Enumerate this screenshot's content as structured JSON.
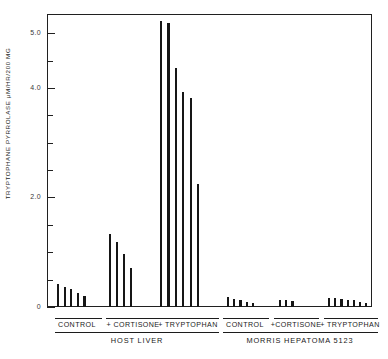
{
  "chart_data": {
    "type": "bar",
    "title": "",
    "xlabel": "",
    "ylabel": "TRYPTOPHANE PYRROLASE  μM/HR/200 MG",
    "ylim": [
      0,
      5.35
    ],
    "grid": false,
    "legend": false,
    "y_ticks_major": [
      {
        "value": 0,
        "label": "0"
      },
      {
        "value": 2.0,
        "label": "2.0"
      },
      {
        "value": 4.0,
        "label": "4.0"
      },
      {
        "value": 5.0,
        "label": "5.0"
      }
    ],
    "y_ticks_minor": [
      0.5,
      1.0,
      1.5,
      2.5,
      3.0,
      3.5,
      4.5
    ],
    "sections": [
      {
        "name": "HOST LIVER",
        "groups": [
          {
            "label": "CONTROL",
            "values": [
              0.42,
              0.36,
              0.33,
              0.25,
              0.2
            ]
          },
          {
            "label": "+ CORTISONE",
            "values": [
              1.33,
              1.18,
              0.96,
              0.72
            ]
          },
          {
            "label": "+ TRYPTOPHAN",
            "values": [
              5.23,
              5.18,
              4.37,
              3.92,
              3.82,
              2.24
            ]
          }
        ]
      },
      {
        "name": "MORRIS HEPATOMA 5123",
        "groups": [
          {
            "label": "CONTROL",
            "values": [
              0.18,
              0.15,
              0.13,
              0.1,
              0.07
            ]
          },
          {
            "label": "+CORTISONE",
            "values": [
              0.13,
              0.12,
              0.11
            ]
          },
          {
            "label": "+ TRYPTOPHAN",
            "values": [
              0.17,
              0.16,
              0.15,
              0.13,
              0.12,
              0.1,
              0.08
            ]
          }
        ]
      }
    ]
  }
}
